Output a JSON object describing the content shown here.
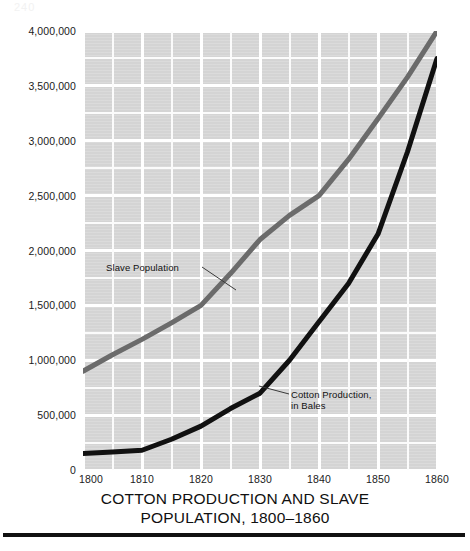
{
  "caption": {
    "line1": "COTTON PRODUCTION AND SLAVE",
    "line2": "POPULATION, 1800–1860"
  },
  "artifact": {
    "text": "240"
  },
  "axes": {
    "y_ticks": [
      "4,000,000",
      "3,500,000",
      "3,000,000",
      "2,500,000",
      "2,000,000",
      "1,500,000",
      "1,000,000",
      "500,000",
      "0"
    ],
    "y_tick_values": [
      4000000,
      3500000,
      3000000,
      2500000,
      2000000,
      1500000,
      1000000,
      500000,
      0
    ],
    "x_ticks": [
      "1800",
      "1810",
      "1820",
      "1830",
      "1840",
      "1850",
      "1860"
    ],
    "x_tick_values": [
      1800,
      1810,
      1820,
      1830,
      1840,
      1850,
      1860
    ]
  },
  "annotations": {
    "slave": "Slave Population",
    "cotton": "Cotton Production,\nin Bales"
  },
  "colors": {
    "plot_background": "#d4d4d4",
    "gridline": "#ffffff",
    "slave_line": "#6b6b6b",
    "cotton_line": "#111111",
    "text": "#121212",
    "caption_rule": "#111111"
  },
  "chart_data": {
    "type": "line",
    "title": "COTTON PRODUCTION AND SLAVE POPULATION, 1800–1860",
    "xlabel": "",
    "ylabel": "",
    "xlim": [
      1800,
      1860
    ],
    "ylim": [
      0,
      4000000
    ],
    "grid": true,
    "grid_x_step": 5,
    "grid_y_step": 250000,
    "legend": "inline-annotations",
    "x": [
      1800,
      1805,
      1810,
      1815,
      1820,
      1825,
      1830,
      1835,
      1840,
      1845,
      1850,
      1855,
      1860
    ],
    "series": [
      {
        "name": "Slave Population",
        "color": "#6b6b6b",
        "line_width": 5,
        "values": [
          900000,
          1050000,
          1190000,
          1340000,
          1500000,
          1790000,
          2100000,
          2320000,
          2500000,
          2830000,
          3200000,
          3580000,
          4000000
        ]
      },
      {
        "name": "Cotton Production, in Bales",
        "color": "#111111",
        "line_width": 5,
        "values": [
          150000,
          165000,
          180000,
          280000,
          400000,
          560000,
          700000,
          1000000,
          1350000,
          1700000,
          2150000,
          2900000,
          3750000
        ]
      }
    ]
  }
}
